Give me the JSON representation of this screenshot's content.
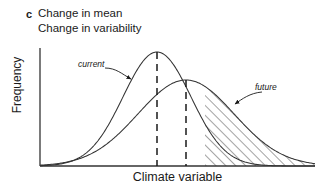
{
  "figure": {
    "panel_label": "c",
    "title_line_1": "Change in mean",
    "title_line_2": "Change in variability",
    "xlabel": "Climate variable",
    "ylabel": "Frequency",
    "annotation_current": "current",
    "annotation_future": "future",
    "line_color": "#333333",
    "text_color": "#1a1a1a",
    "background": "#ffffff"
  },
  "chart_data": {
    "type": "line",
    "xlabel": "Climate variable",
    "ylabel": "Frequency",
    "grid": false,
    "legend_position": "inline-annotations",
    "axis_box": {
      "x_left": 40,
      "x_right": 315,
      "y_top": 48,
      "y_baseline": 166
    },
    "series": [
      {
        "name": "current",
        "style": "solid",
        "description": "Current climate probability distribution: narrow, tall normal curve",
        "mean_px": 157,
        "peak_y_px": 52,
        "sigma_px": 34,
        "peak_amplitude": 1.0,
        "mean_dashed_line_x_px": 157
      },
      {
        "name": "future",
        "style": "solid",
        "description": "Future climate probability distribution: broader, lower normal curve shifted right",
        "mean_px": 186,
        "peak_y_px": 80,
        "sigma_px": 48,
        "peak_amplitude": 0.73,
        "mean_dashed_line_x_px": 186
      }
    ],
    "dashed_lines": [
      {
        "label": "current mean",
        "x_px": 157,
        "from_y_px": 52,
        "to_y_px": 166
      },
      {
        "label": "future mean",
        "x_px": 186,
        "from_y_px": 80,
        "to_y_px": 166
      }
    ],
    "shaded_regions": [
      {
        "label": "increased hot/extreme tail",
        "pattern": "diagonal-hatch",
        "series": "future",
        "x_start_px": 205,
        "x_end_px": 315
      }
    ],
    "annotations": [
      {
        "text": "current",
        "x_px": 78,
        "y_px": 59,
        "arrow_to_x_px": 134,
        "arrow_to_y_px": 80
      },
      {
        "text": "future",
        "x_px": 255,
        "y_px": 82,
        "arrow_to_x_px": 232,
        "arrow_to_y_px": 106
      }
    ]
  }
}
